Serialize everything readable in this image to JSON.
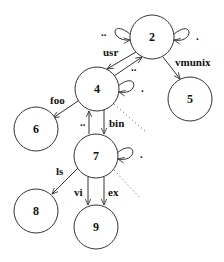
{
  "diagram": {
    "type": "directory-graph",
    "nodes": [
      {
        "id": "2",
        "label": "2",
        "cx": 152,
        "cy": 37
      },
      {
        "id": "4",
        "label": "4",
        "cx": 97,
        "cy": 89
      },
      {
        "id": "5",
        "label": "5",
        "cx": 190,
        "cy": 99
      },
      {
        "id": "6",
        "label": "6",
        "cx": 36,
        "cy": 129
      },
      {
        "id": "7",
        "label": "7",
        "cx": 96,
        "cy": 156
      },
      {
        "id": "8",
        "label": "8",
        "cx": 36,
        "cy": 211
      },
      {
        "id": "9",
        "label": "9",
        "cx": 96,
        "cy": 227
      }
    ],
    "edges": [
      {
        "from": "2",
        "to": "2",
        "label": "..",
        "kind": "self-loop-left"
      },
      {
        "from": "2",
        "to": "2",
        "label": ".",
        "kind": "self-loop-right"
      },
      {
        "from": "2",
        "to": "4",
        "label": "usr"
      },
      {
        "from": "4",
        "to": "2",
        "label": ".."
      },
      {
        "from": "2",
        "to": "5",
        "label": "vmunix"
      },
      {
        "from": "4",
        "to": "4",
        "label": ".",
        "kind": "self-loop-right"
      },
      {
        "from": "4",
        "to": "6",
        "label": "foo"
      },
      {
        "from": "4",
        "to": "7",
        "label": "bin"
      },
      {
        "from": "7",
        "to": "4",
        "label": ".."
      },
      {
        "from": "7",
        "to": "7",
        "label": ".",
        "kind": "self-loop-right"
      },
      {
        "from": "7",
        "to": "8",
        "label": "ls"
      },
      {
        "from": "7",
        "to": "9",
        "label": "vi"
      },
      {
        "from": "7",
        "to": "9",
        "label": "ex"
      }
    ],
    "labels": {
      "node_2": "2",
      "node_4": "4",
      "node_5": "5",
      "node_6": "6",
      "node_7": "7",
      "node_8": "8",
      "node_9": "9",
      "usr": "usr",
      "vmunix": "vmunix",
      "foo": "foo",
      "bin": "bin",
      "ls": "ls",
      "vi": "vi",
      "ex": "ex",
      "dotdot": "..",
      "dot": "."
    }
  }
}
